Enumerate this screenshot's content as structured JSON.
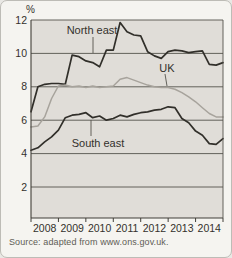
{
  "figure": {
    "source": "Source: adapted from www.ons.gov.uk."
  },
  "chart_data": {
    "type": "line",
    "title": "",
    "ylabel": "%",
    "xlabel": "",
    "grid": "horizontal",
    "legend_position": "inline-labels",
    "plot_bg": "#e0ddd8",
    "x_range": [
      2008,
      2015
    ],
    "ylim": [
      0.2,
      12
    ],
    "y_ticks": [
      2,
      4,
      6,
      8,
      10,
      12
    ],
    "x_tick_labels": [
      "2008",
      "2009",
      "2010",
      "2011",
      "2012",
      "2013",
      "2014"
    ],
    "x_start": 2008.0,
    "x_step": 0.25,
    "series": [
      {
        "name": "North east",
        "color": "#312f2a",
        "width": 1.7,
        "values": [
          6.5,
          8.0,
          8.15,
          8.2,
          8.2,
          8.15,
          9.9,
          9.8,
          9.55,
          9.45,
          9.2,
          10.2,
          10.2,
          11.85,
          11.3,
          11.1,
          11.05,
          10.1,
          9.85,
          9.7,
          10.1,
          10.2,
          10.15,
          10.05,
          10.1,
          10.15,
          9.35,
          9.3,
          9.45
        ]
      },
      {
        "name": "UK",
        "color": "#a7a39c",
        "width": 1.5,
        "values": [
          5.6,
          5.65,
          6.2,
          7.3,
          8.05,
          8.1,
          8.0,
          8.05,
          7.95,
          8.05,
          7.95,
          8.0,
          8.05,
          8.45,
          8.55,
          8.4,
          8.25,
          8.1,
          8.0,
          7.95,
          7.95,
          7.85,
          7.65,
          7.4,
          7.1,
          6.75,
          6.4,
          6.2,
          6.2
        ]
      },
      {
        "name": "South east",
        "color": "#312f2a",
        "width": 1.7,
        "values": [
          4.2,
          4.35,
          4.7,
          5.0,
          5.4,
          6.15,
          6.3,
          6.35,
          6.45,
          6.15,
          6.25,
          6.0,
          6.1,
          6.3,
          6.2,
          6.35,
          6.45,
          6.5,
          6.6,
          6.65,
          6.8,
          6.75,
          6.1,
          5.85,
          5.35,
          5.1,
          4.6,
          4.55,
          4.9
        ]
      }
    ],
    "source": "Source: adapted from www.ons.gov.uk."
  }
}
